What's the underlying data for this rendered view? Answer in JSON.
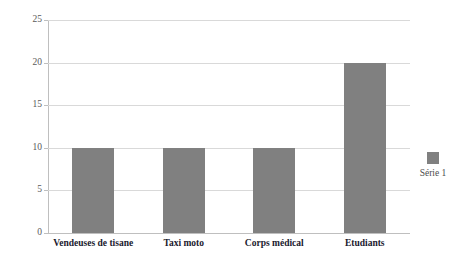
{
  "chart_data": {
    "type": "bar",
    "title": "",
    "subtitle": "",
    "xlabel": "",
    "ylabel": "",
    "categories": [
      "Vendeuses de tisane",
      "Taxi moto",
      "Corps médical",
      "Etudiants"
    ],
    "series": [
      {
        "name": "Série 1",
        "values": [
          10,
          10,
          10,
          20
        ],
        "color": "#808080"
      }
    ],
    "ylim": [
      0,
      25
    ],
    "y_ticks": [
      0,
      5,
      10,
      15,
      20,
      25
    ],
    "y_tick_labels": [
      "0",
      "5",
      "10",
      "15",
      "20",
      "25"
    ],
    "grid": true,
    "grid_axis": "y",
    "legend": {
      "visible": true,
      "position": "right",
      "entries": [
        "Série 1"
      ]
    },
    "colors": {
      "bar": "#808080",
      "gridline": "#d9d9d9",
      "axis": "#bfbfbf",
      "tick_label": "#595959",
      "category_label": "#1a1a2e",
      "legend_label": "#4d4d4d",
      "background": "#ffffff"
    }
  }
}
